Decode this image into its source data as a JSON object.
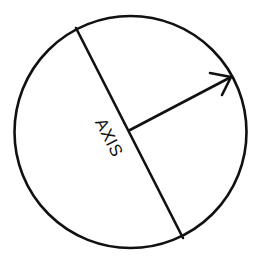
{
  "diagram": {
    "canvas": {
      "width": 259,
      "height": 264,
      "background": "#ffffff"
    },
    "colors": {
      "stroke": "#111111"
    },
    "circle": {
      "cx": 130.5,
      "cy": 132,
      "r": 116
    },
    "axis": {
      "label": "AXIS",
      "start": {
        "x": 76,
        "y": 28
      },
      "end": {
        "x": 183,
        "y": 238
      },
      "label_position": {
        "x": 108,
        "y": 138
      },
      "label_rotation_deg": 63
    },
    "radius_arrow": {
      "start": {
        "x": 130,
        "y": 130
      },
      "tip": {
        "x": 231,
        "y": 77
      },
      "head_left": {
        "x": 210,
        "y": 73
      },
      "head_right": {
        "x": 222,
        "y": 95
      }
    }
  }
}
